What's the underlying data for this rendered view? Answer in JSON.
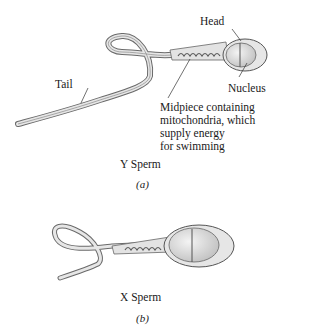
{
  "figure_a": {
    "labels": {
      "head": "Head",
      "tail": "Tail",
      "nucleus": "Nucleus",
      "midpiece_lines": [
        "Midpiece containing",
        "mitochondria, which",
        "supply energy",
        "for swimming"
      ]
    },
    "title": "Y Sperm",
    "caption": "(a)"
  },
  "figure_b": {
    "title": "X Sperm",
    "caption": "(b)"
  },
  "colors": {
    "outline": "#555555",
    "fill_light": "#e8e8e8",
    "fill_head": "#d9d9d9",
    "text": "#1a1a1a"
  }
}
